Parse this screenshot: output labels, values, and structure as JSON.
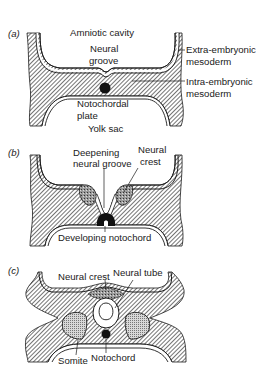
{
  "figure": {
    "panels": [
      {
        "id": "a",
        "tag": "(a)",
        "labels": {
          "amniotic_cavity": "Amniotic cavity",
          "neural_groove_1": "Neural",
          "neural_groove_2": "groove",
          "extra_1": "Extra-embryonic",
          "extra_2": "mesoderm",
          "intra_1": "Intra-embryonic",
          "intra_2": "mesoderm",
          "notochordal_1": "Notochordal",
          "notochordal_2": "plate",
          "yolk_sac": "Yolk sac"
        }
      },
      {
        "id": "b",
        "tag": "(b)",
        "labels": {
          "deepening_1": "Deepening",
          "deepening_2": "neural groove",
          "crest_1": "Neural",
          "crest_2": "crest",
          "developing_notochord": "Developing notochord"
        }
      },
      {
        "id": "c",
        "tag": "(c)",
        "labels": {
          "neural_crest": "Neural crest",
          "neural_tube": "Neural tube",
          "somite": "Somite",
          "notochord": "Notochord"
        }
      }
    ],
    "colors": {
      "ink": "#1a1a1a",
      "hatch": "#2a2a2a",
      "background": "#ffffff",
      "stipple": "#8a8a8a"
    }
  }
}
